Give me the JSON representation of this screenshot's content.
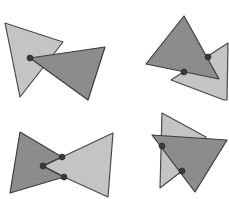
{
  "diagram": {
    "title": "",
    "colors": {
      "light_triangle": "#c4c4c4",
      "dark_triangle": "#8c8c8c",
      "outline": "#3c3c3c",
      "joint": "#3a3a3a",
      "background": "#ffffff"
    },
    "panels": [
      {
        "id": "top-left",
        "light_triangle": "5,23 63,42 20,97",
        "dark_triangle": "30,58 105,47 88,100",
        "joints": [
          {
            "x": 30,
            "y": 58
          }
        ],
        "links": []
      },
      {
        "id": "top-right",
        "light_triangle": "228,43 171,80 224,100 227,100",
        "dark_triangle": "184,16 146,64 219,79",
        "joints": [
          {
            "x": 208,
            "y": 57
          },
          {
            "x": 184,
            "y": 72
          }
        ],
        "links": []
      },
      {
        "id": "bottom-left",
        "light_triangle": "113,133 62,157 43,166 64,177 108,197",
        "dark_triangle": "20,132 62,157 43,166 64,177 10,193",
        "joints": [
          {
            "x": 62,
            "y": 157
          },
          {
            "x": 43,
            "y": 166
          },
          {
            "x": 64,
            "y": 177
          }
        ],
        "links": [
          {
            "points": "62,157 43,166 64,177"
          }
        ]
      },
      {
        "id": "bottom-right",
        "light_triangle": "162,113 206,137 182,171 160,188",
        "dark_triangle": "152,135 227,140 195,192",
        "joints": [
          {
            "x": 162,
            "y": 146
          },
          {
            "x": 182,
            "y": 171
          }
        ],
        "links": []
      }
    ]
  }
}
